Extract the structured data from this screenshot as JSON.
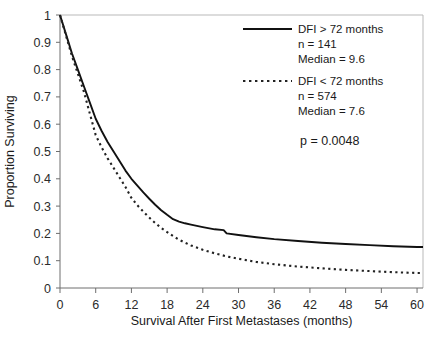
{
  "chart_data": {
    "type": "line",
    "title": "",
    "xlabel": "Survival After First Metastases (months)",
    "ylabel": "Proportion Surviving",
    "xlim": [
      0,
      61
    ],
    "ylim": [
      0,
      1
    ],
    "xticks": [
      0,
      6,
      12,
      18,
      24,
      30,
      36,
      42,
      48,
      54,
      60
    ],
    "xtick_labels": [
      "0",
      "6",
      "12",
      "18",
      "24",
      "30",
      "36",
      "42",
      "48",
      "54",
      "60"
    ],
    "yticks": [
      0,
      0.1,
      0.2,
      0.3,
      0.4,
      0.5,
      0.6,
      0.7,
      0.8,
      0.9,
      1
    ],
    "ytick_labels": [
      "0",
      "0.1",
      "0.2",
      "0.3",
      "0.4",
      "0.5",
      "0.6",
      "0.7",
      "0.8",
      "0.9",
      "1"
    ],
    "grid": false,
    "legend_position": "upper-right",
    "annotations": [
      {
        "name": "p-value",
        "text": "p = 0.0048"
      }
    ],
    "series": [
      {
        "name": "DFI > 72 months",
        "style": "solid",
        "color": "#111111",
        "n": 141,
        "median": 9.6,
        "legend_label": "DFI > 72 months",
        "legend_n": "n = 141",
        "legend_median": "Median = 9.6",
        "x": [
          0,
          1,
          2,
          3,
          4,
          5,
          6,
          7,
          8,
          9,
          10,
          11,
          12,
          13,
          14,
          15,
          16,
          17,
          18,
          19,
          20,
          21,
          22,
          24,
          26,
          27.5,
          28,
          30,
          33,
          36,
          40,
          44,
          48,
          52,
          56,
          60,
          61
        ],
        "y": [
          1.0,
          0.93,
          0.86,
          0.8,
          0.74,
          0.68,
          0.62,
          0.575,
          0.535,
          0.5,
          0.465,
          0.43,
          0.4,
          0.375,
          0.35,
          0.327,
          0.305,
          0.285,
          0.268,
          0.252,
          0.243,
          0.237,
          0.232,
          0.223,
          0.215,
          0.212,
          0.2,
          0.194,
          0.186,
          0.179,
          0.172,
          0.166,
          0.161,
          0.157,
          0.153,
          0.15,
          0.15
        ]
      },
      {
        "name": "DFI < 72 months",
        "style": "dotted",
        "color": "#222222",
        "n": 574,
        "median": 7.6,
        "legend_label": "DFI < 72 months",
        "legend_n": "n = 574",
        "legend_median": "Median = 7.6",
        "x": [
          0,
          1,
          2,
          3,
          4,
          5,
          6,
          7,
          8,
          9,
          10,
          11,
          12,
          13,
          14,
          15,
          16,
          17,
          18,
          19,
          20,
          21,
          22,
          24,
          26,
          28,
          30,
          33,
          36,
          40,
          44,
          48,
          52,
          56,
          60,
          61
        ],
        "y": [
          1.0,
          0.925,
          0.85,
          0.785,
          0.72,
          0.64,
          0.56,
          0.515,
          0.475,
          0.44,
          0.405,
          0.37,
          0.33,
          0.303,
          0.28,
          0.258,
          0.238,
          0.22,
          0.205,
          0.19,
          0.177,
          0.166,
          0.156,
          0.14,
          0.127,
          0.116,
          0.107,
          0.0955,
          0.087,
          0.0785,
          0.072,
          0.0665,
          0.062,
          0.058,
          0.055,
          0.055
        ]
      }
    ]
  },
  "legend": {
    "entry1": {
      "label": "DFI > 72 months",
      "n": "n = 141",
      "median": "Median = 9.6"
    },
    "entry2": {
      "label": "DFI < 72 months",
      "n": "n = 574",
      "median": "Median = 7.6"
    },
    "pvalue": "p = 0.0048"
  },
  "axes": {
    "x_title": "Survival After First Metastases (months)",
    "y_title": "Proportion Surviving"
  },
  "colors": {
    "solid_series": "#111111",
    "dotted_series": "#222222",
    "frame": "#b9b9b9",
    "axis": "#6e6e6e",
    "text": "#1a1a1a"
  }
}
